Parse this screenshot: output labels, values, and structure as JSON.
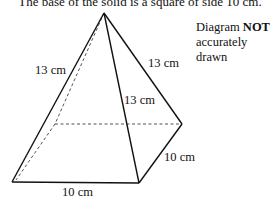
{
  "caption": "The base of the solid is a square of side 10 cm.",
  "note": {
    "line1_prefix": "Diagram ",
    "line1_bold": "NOT",
    "line2": "accurately drawn"
  },
  "labels": {
    "left_edge": "13 cm",
    "right_edge": "13 cm",
    "front_edge": "13 cm",
    "base_front": "10 cm",
    "base_right": "10 cm"
  },
  "colors": {
    "line": "#111111",
    "hidden_line": "#555555",
    "background": "#ffffff"
  }
}
